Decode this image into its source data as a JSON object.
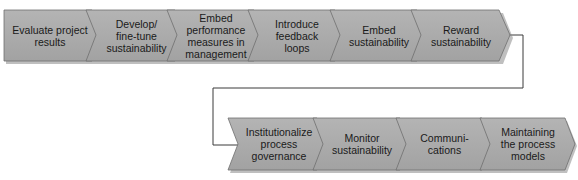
{
  "diagram": {
    "colors": {
      "fill": "#a9a9a9",
      "fill_light": "#bdbdbd",
      "stroke": "#6e6e6e",
      "shadow": "#8a8a8a",
      "connector": "#3a3a3a",
      "text": "#1a1a1a"
    },
    "top_row": [
      {
        "label": "Evaluate project\nresults"
      },
      {
        "label": "Develop/\nfine-tune\nsustainability"
      },
      {
        "label": "Embed\nperformance\nmeasures in\nmanagement"
      },
      {
        "label": "Introduce\nfeedback\nloops"
      },
      {
        "label": "Embed\nsustainability"
      },
      {
        "label": "Reward\nsustainability"
      }
    ],
    "bottom_row": [
      {
        "label": "Institutionalize\nprocess\ngovernance"
      },
      {
        "label": "Monitor\nsustainability"
      },
      {
        "label": "Communi-\ncations"
      },
      {
        "label": "Maintaining\nthe process\nmodels"
      }
    ],
    "connector": {
      "from": "Reward sustainability",
      "to": "Institutionalize process governance"
    }
  }
}
